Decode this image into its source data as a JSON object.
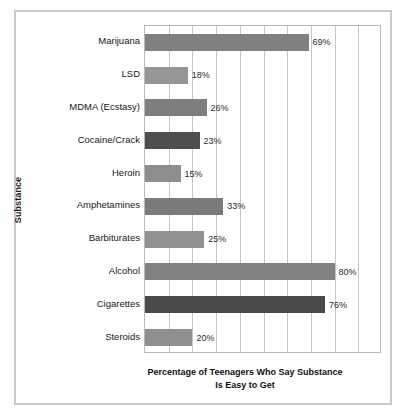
{
  "chart_data": {
    "type": "bar",
    "orientation": "horizontal",
    "title": "",
    "xlabel": "Percentage of Teenagers Who Say Substance Is Easy to Get",
    "xlabel_lines": [
      "Percentage of Teenagers Who Say Substance",
      "Is Easy to Get"
    ],
    "ylabel": "Substance",
    "categories": [
      "Marijuana",
      "LSD",
      "MDMA (Ecstasy)",
      "Cocaine/Crack",
      "Heroin",
      "Amphetamines",
      "Barbiturates",
      "Alcohol",
      "Cigarettes",
      "Steroids"
    ],
    "values": [
      69,
      18,
      26,
      23,
      15,
      33,
      25,
      80,
      76,
      20
    ],
    "value_labels": [
      "69%",
      "18%",
      "26%",
      "23%",
      "15%",
      "33%",
      "25%",
      "80%",
      "76%",
      "20%"
    ],
    "bar_colors": [
      "#808080",
      "#969696",
      "#7e7e7e",
      "#4e4e4e",
      "#8d8d8d",
      "#7b7b7b",
      "#919191",
      "#828282",
      "#4a4a4a",
      "#8f8f8f"
    ],
    "xlim": [
      0,
      100
    ],
    "x_gridline_step": 10,
    "grid": true,
    "legend": "none",
    "x_tick_labels_visible": false,
    "axis_frame_color": "#b9b9bd",
    "gridline_color": "#c5c5c9",
    "outer_frame_color": "#c9c9cc",
    "background_color": "#ffffff"
  }
}
